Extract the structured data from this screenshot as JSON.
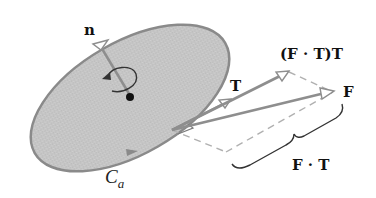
{
  "diagram": {
    "labels": {
      "normal": "n",
      "tangent": "T",
      "projection_vector": "(F · T)T",
      "force": "F",
      "scalar_projection": "F · T",
      "curve": "C",
      "curve_subscript": "a"
    },
    "colors": {
      "surface_fill": "#c4c4c4",
      "surface_edge": "#8a8a8a",
      "vector": "#8e8e8e",
      "dashed": "#b0b0b0",
      "text": "#111111",
      "background": "#ffffff"
    }
  }
}
